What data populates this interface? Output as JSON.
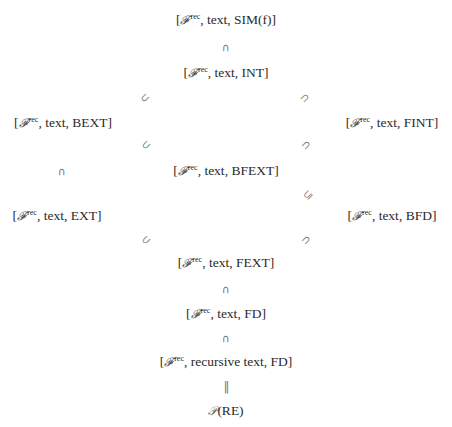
{
  "diagram": {
    "type": "inclusion-hierarchy",
    "script_symbol": "𝓕",
    "superscript": "rec",
    "nodes": [
      {
        "id": "sim",
        "prefix": "[",
        "second": "text",
        "third": "SIM(f)",
        "label": "[𝓕rec, text, SIM(f)]"
      },
      {
        "id": "int",
        "prefix": "[",
        "second": "text",
        "third": "INT",
        "label": "[𝓕rec, text, INT]"
      },
      {
        "id": "bext",
        "prefix": "[",
        "second": "text",
        "third": "BEXT",
        "label": "[𝓕rec, text, BEXT]"
      },
      {
        "id": "fint",
        "prefix": "[",
        "second": "text",
        "third": "FINT",
        "label": "[𝓕rec, text, FINT]"
      },
      {
        "id": "bfext",
        "prefix": "[",
        "second": "text",
        "third": "BFEXT",
        "label": "[𝓕rec, text, BFEXT]"
      },
      {
        "id": "ext",
        "prefix": "[",
        "second": "text",
        "third": "EXT",
        "label": "[𝓕rec, text, EXT]"
      },
      {
        "id": "bfd",
        "prefix": "[",
        "second": "text",
        "third": "BFD",
        "label": "[𝓕rec, text, BFD]"
      },
      {
        "id": "fext",
        "prefix": "[",
        "second": "text",
        "third": "FEXT",
        "label": "[𝓕rec, text, FEXT]"
      },
      {
        "id": "fd",
        "prefix": "[",
        "second": "text",
        "third": "FD",
        "label": "[𝓕rec, text, FD]"
      },
      {
        "id": "recfd",
        "prefix": "[",
        "second": "recursive text",
        "third": "FD",
        "label": "[𝓕rec, recursive text, FD]"
      },
      {
        "id": "re",
        "label": "𝒫(RE)",
        "script": "𝒫",
        "text": "(RE)"
      }
    ],
    "relations": [
      {
        "from": "sim",
        "to": "int",
        "symbol": "∩"
      },
      {
        "from": "int",
        "to": "bext",
        "symbol": "⊃"
      },
      {
        "from": "int",
        "to": "fint",
        "symbol": "⊂"
      },
      {
        "from": "bext",
        "to": "bfext",
        "symbol": "⊂"
      },
      {
        "from": "fint",
        "to": "bfext",
        "symbol": "⊃"
      },
      {
        "from": "bext",
        "to": "ext",
        "symbol": "∩"
      },
      {
        "from": "bfext",
        "to": "bfd",
        "symbol": "⊆"
      },
      {
        "from": "ext",
        "to": "fext",
        "symbol": "⊂"
      },
      {
        "from": "bfd",
        "to": "fext",
        "symbol": "⊃"
      },
      {
        "from": "fext",
        "to": "fd",
        "symbol": "∩"
      },
      {
        "from": "fd",
        "to": "recfd",
        "symbol": "∩"
      },
      {
        "from": "recfd",
        "to": "re",
        "symbol": "‖"
      }
    ]
  }
}
